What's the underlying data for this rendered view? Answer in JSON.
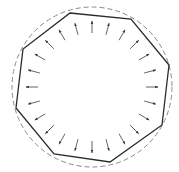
{
  "diagram": {
    "width": 179,
    "height": 172,
    "colors": {
      "background": "#ffffff",
      "polygon": "#2a2a2a",
      "circle": "#8a8a8a",
      "arrow": "#3a3a3a"
    },
    "circle": {
      "cx": 92,
      "cy": 87,
      "r": 80,
      "style": "dashed"
    },
    "polygon": {
      "sides": 8,
      "vertices": [
        [
          70,
          13
        ],
        [
          131,
          19
        ],
        [
          169,
          65
        ],
        [
          162,
          125
        ],
        [
          110,
          162
        ],
        [
          54,
          154
        ],
        [
          16,
          108
        ],
        [
          23,
          49
        ]
      ]
    },
    "arrows": {
      "count": 24,
      "direction": "radially-outward",
      "center": [
        92,
        87
      ],
      "inner_radius": 54,
      "outer_radius": 66,
      "start_angle_deg": -90
    }
  }
}
